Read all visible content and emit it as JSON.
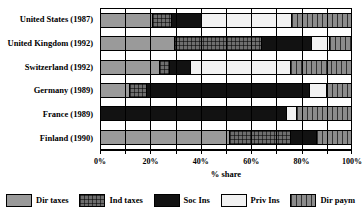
{
  "chart_data": {
    "type": "bar",
    "orientation": "horizontal",
    "stacked": true,
    "normalized": true,
    "title": "",
    "xlabel": "% share",
    "ylabel": "",
    "xlim": [
      0,
      100
    ],
    "xticks": [
      0,
      10,
      20,
      30,
      40,
      50,
      60,
      70,
      80,
      90,
      100
    ],
    "xtick_labels": [
      "0%",
      "",
      "20%",
      "",
      "40%",
      "",
      "60%",
      "",
      "80%",
      "",
      "100%"
    ],
    "grid": "vertical",
    "legend_position": "bottom",
    "categories": [
      "United States (1987)",
      "United Kingdom (1992)",
      "Switzerland (1992)",
      "Germany (1989)",
      "France (1989)",
      "Finland (1990)"
    ],
    "series": [
      {
        "name": "Dir taxes",
        "pattern": "solid-gray",
        "color": "#9a9a9a",
        "values": [
          20.5,
          29.0,
          23.0,
          11.0,
          0.0,
          51.0
        ]
      },
      {
        "name": "Ind taxes",
        "pattern": "crosshatch-dark",
        "color": "#6e6e6e",
        "values": [
          7.5,
          35.0,
          4.0,
          7.0,
          0.0,
          24.5
        ]
      },
      {
        "name": "Soc Ins",
        "pattern": "solid-black",
        "color": "#121212",
        "values": [
          12.0,
          20.0,
          8.5,
          65.0,
          74.0,
          10.5
        ]
      },
      {
        "name": "Priv Ins",
        "pattern": "solid-white",
        "color": "#f2f2f2",
        "values": [
          36.0,
          7.0,
          40.0,
          7.0,
          4.0,
          0.0
        ]
      },
      {
        "name": "Dir paym",
        "pattern": "vertical-stripes",
        "color": "#8c8c8c",
        "values": [
          24.0,
          9.0,
          24.5,
          10.0,
          22.0,
          14.0
        ]
      }
    ]
  },
  "axis": {
    "x_title": "% share",
    "tick_labels": [
      {
        "value": 0,
        "label": "0%"
      },
      {
        "value": 20,
        "label": "20%"
      },
      {
        "value": 40,
        "label": "40%"
      },
      {
        "value": 60,
        "label": "60%"
      },
      {
        "value": 80,
        "label": "80%"
      },
      {
        "value": 100,
        "label": "100%"
      }
    ]
  },
  "legend": {
    "items": [
      {
        "label": "Dir taxes",
        "key": "dirtaxes"
      },
      {
        "label": "Ind taxes",
        "key": "indtaxes"
      },
      {
        "label": "Soc Ins",
        "key": "socins"
      },
      {
        "label": "Priv Ins",
        "key": "privins"
      },
      {
        "label": "Dir paym",
        "key": "dirpaym"
      }
    ]
  }
}
